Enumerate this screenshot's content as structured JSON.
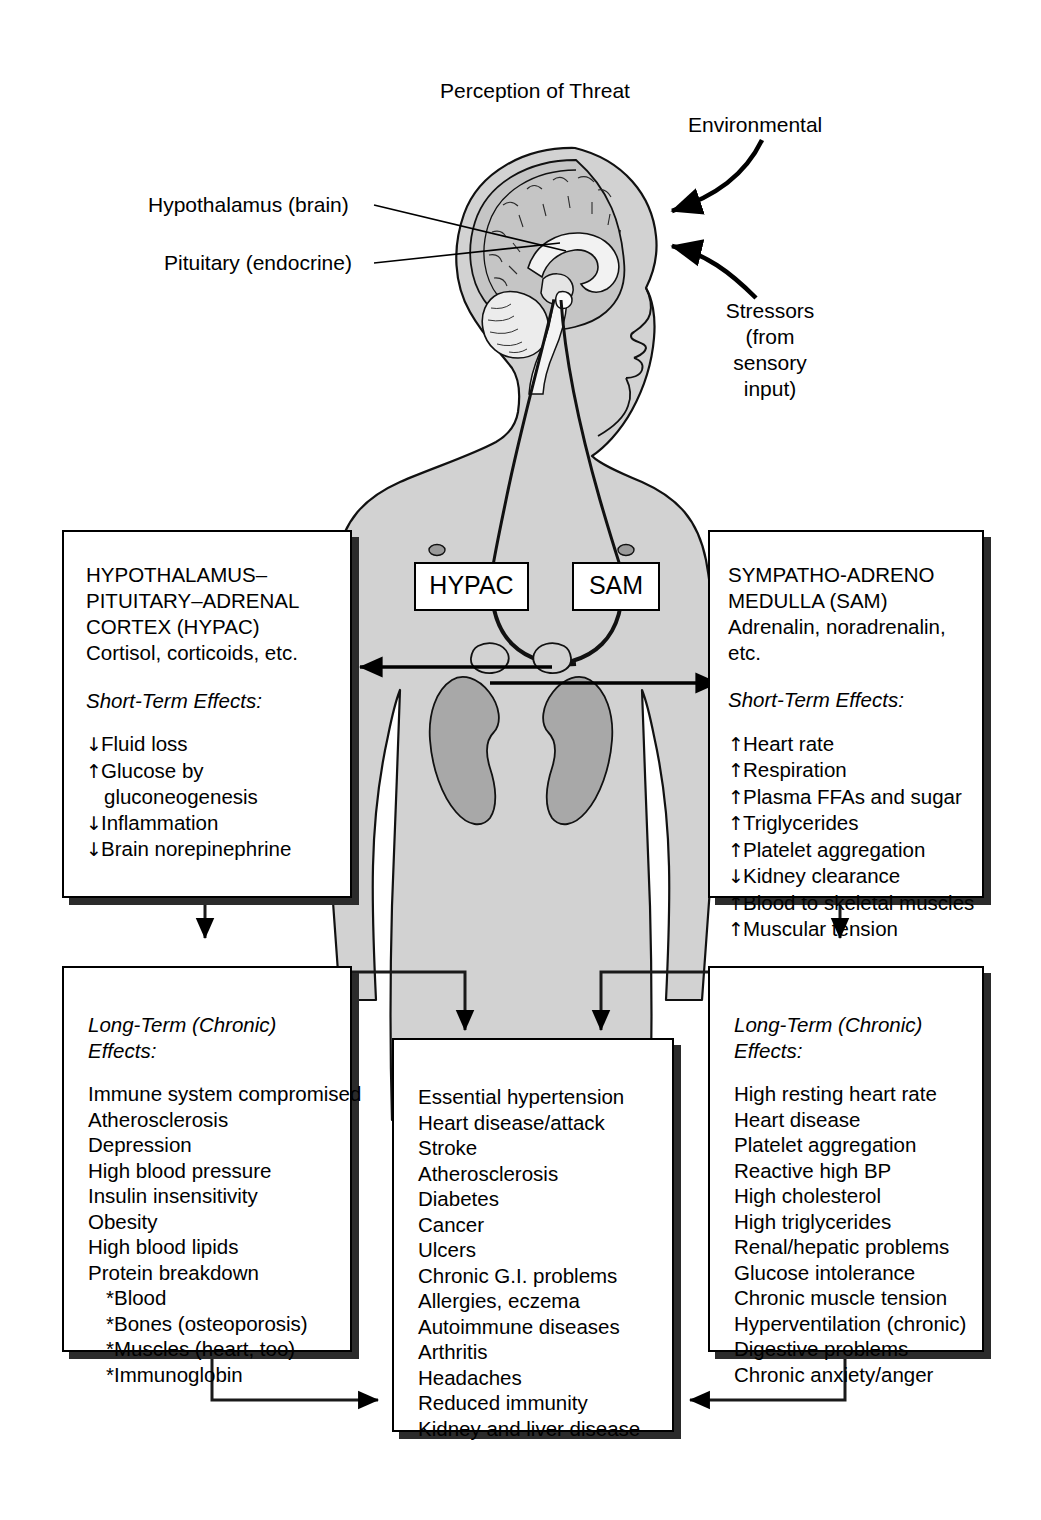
{
  "title": "Perception of Threat",
  "annotations": {
    "environmental": "Environmental",
    "stressors": "Stressors\n(from\nsensory\ninput)",
    "hypothalamus": "Hypothalamus (brain)",
    "pituitary": "Pituitary (endocrine)"
  },
  "midlabels": {
    "hypac": "HYPAC",
    "sam": "SAM"
  },
  "left_box": {
    "heading": "HYPOTHALAMUS–\nPITUITARY–ADRENAL\nCORTEX (HYPAC)",
    "hormones": "Cortisol, corticoids, etc.",
    "effects_label": "Short-Term Effects:",
    "effects": [
      {
        "dir": "down",
        "text": "Fluid loss"
      },
      {
        "dir": "up",
        "text": "Glucose by"
      },
      {
        "dir": "none",
        "text": "gluconeogenesis"
      },
      {
        "dir": "down",
        "text": "Inflammation"
      },
      {
        "dir": "down",
        "text": "Brain norepinephrine"
      }
    ]
  },
  "right_box": {
    "heading": "SYMPATHO-ADRENO\nMEDULLA (SAM)",
    "hormones": "Adrenalin, noradrenalin, etc.",
    "effects_label": "Short-Term Effects:",
    "effects": [
      {
        "dir": "up",
        "text": "Heart rate"
      },
      {
        "dir": "up",
        "text": "Respiration"
      },
      {
        "dir": "up",
        "text": "Plasma FFAs and sugar"
      },
      {
        "dir": "up",
        "text": "Triglycerides"
      },
      {
        "dir": "up",
        "text": "Platelet aggregation"
      },
      {
        "dir": "down",
        "text": "Kidney clearance"
      },
      {
        "dir": "up",
        "text": "Blood to skeletal muscles"
      },
      {
        "dir": "up",
        "text": "Muscular tension"
      }
    ]
  },
  "left_bottom_box": {
    "effects_label": "Long-Term (Chronic) Effects:",
    "items": [
      {
        "text": "Immune system compromised",
        "indent": false
      },
      {
        "text": "Atherosclerosis",
        "indent": false
      },
      {
        "text": "Depression",
        "indent": false
      },
      {
        "text": "High blood pressure",
        "indent": false
      },
      {
        "text": "Insulin insensitivity",
        "indent": false
      },
      {
        "text": "Obesity",
        "indent": false
      },
      {
        "text": "High blood lipids",
        "indent": false
      },
      {
        "text": "Protein breakdown",
        "indent": false
      },
      {
        "text": "*Blood",
        "indent": true
      },
      {
        "text": "*Bones (osteoporosis)",
        "indent": true
      },
      {
        "text": "*Muscles (heart, too)",
        "indent": true
      },
      {
        "text": "*Immunoglobin",
        "indent": true
      }
    ]
  },
  "right_bottom_box": {
    "effects_label": "Long-Term (Chronic) Effects:",
    "items": [
      {
        "text": "High resting heart rate",
        "indent": false
      },
      {
        "text": "Heart disease",
        "indent": false
      },
      {
        "text": "Platelet aggregation",
        "indent": false
      },
      {
        "text": "Reactive high BP",
        "indent": false
      },
      {
        "text": "High cholesterol",
        "indent": false
      },
      {
        "text": "High triglycerides",
        "indent": false
      },
      {
        "text": "Renal/hepatic problems",
        "indent": false
      },
      {
        "text": "Glucose intolerance",
        "indent": false
      },
      {
        "text": "Chronic muscle tension",
        "indent": false
      },
      {
        "text": "Hyperventilation (chronic)",
        "indent": false
      },
      {
        "text": "Digestive problems",
        "indent": false
      },
      {
        "text": "Chronic anxiety/anger",
        "indent": false
      }
    ]
  },
  "center_bottom_box": {
    "items": [
      {
        "text": "Essential hypertension",
        "indent": false
      },
      {
        "text": "Heart disease/attack",
        "indent": false
      },
      {
        "text": "Stroke",
        "indent": false
      },
      {
        "text": "Atherosclerosis",
        "indent": false
      },
      {
        "text": "Diabetes",
        "indent": false
      },
      {
        "text": "Cancer",
        "indent": false
      },
      {
        "text": "Ulcers",
        "indent": false
      },
      {
        "text": "Chronic G.I. problems",
        "indent": false
      },
      {
        "text": "Allergies, eczema",
        "indent": false
      },
      {
        "text": "Autoimmune diseases",
        "indent": false
      },
      {
        "text": "Arthritis",
        "indent": false
      },
      {
        "text": "Headaches",
        "indent": false
      },
      {
        "text": "Reduced immunity",
        "indent": false
      },
      {
        "text": "Kidney and liver disease",
        "indent": false
      }
    ]
  },
  "colors": {
    "body_fill": "#d2d2d2",
    "brain_fill": "#c2c2c2",
    "kidney_fill": "#a8a8a8",
    "outline": "#000000",
    "shadow": "#2b2b2b"
  }
}
